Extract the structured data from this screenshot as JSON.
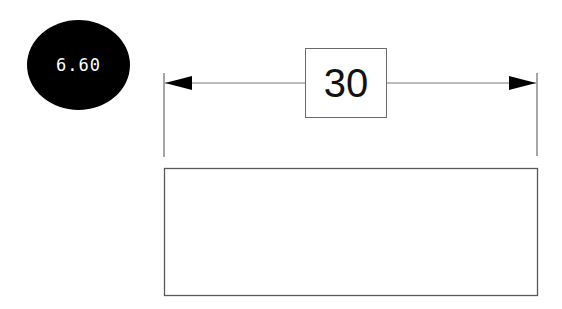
{
  "badge": {
    "value": "6.60",
    "background": "#000000",
    "text_color": "#ffffff"
  },
  "dimension": {
    "label": "30",
    "line_color": "#6b6b6b",
    "arrow_color": "#000000",
    "left_extension_x": 164,
    "right_extension_x": 537,
    "line_y": 83
  },
  "shape": {
    "type": "rectangle",
    "stroke": "#5a5a5a",
    "fill": "#ffffff"
  }
}
